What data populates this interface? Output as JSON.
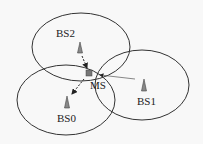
{
  "diagram": {
    "cells": [
      {
        "id": "cell-bs2",
        "cx": 81,
        "cy": 47,
        "rx": 49,
        "ry": 34
      },
      {
        "id": "cell-bs0",
        "cx": 66,
        "cy": 100,
        "rx": 49,
        "ry": 35
      },
      {
        "id": "cell-bs1",
        "cx": 142,
        "cy": 85,
        "rx": 47,
        "ry": 35
      }
    ],
    "labels": {
      "bs2": "BS2",
      "bs0": "BS0",
      "bs1": "BS1",
      "ms": "MS"
    },
    "colors": {
      "stroke": "#333333",
      "antenna": "#888888",
      "ms": "#777777"
    }
  }
}
